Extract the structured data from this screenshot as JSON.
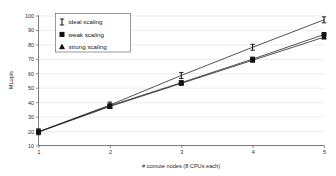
{
  "chart_data": {
    "type": "line",
    "title": "",
    "xlabel": "# comute nodes (8 CPUs each)",
    "ylabel": "MLup/s",
    "x": [
      1,
      2,
      3,
      4,
      5
    ],
    "xticklabels": [
      "1",
      "2",
      "3",
      "4",
      "5"
    ],
    "yticklabels": [
      "10",
      "20",
      "30",
      "40",
      "50",
      "60",
      "70",
      "80",
      "90",
      "100"
    ],
    "yticks": [
      10,
      20,
      30,
      40,
      50,
      60,
      70,
      80,
      90,
      100
    ],
    "xlim": [
      1,
      5
    ],
    "ylim": [
      10,
      100
    ],
    "grid": true,
    "legend_position": "upper-left",
    "series": [
      {
        "name": "ideal scaling",
        "marker": "errorbar-i",
        "values": [
          19.5,
          38.0,
          58.5,
          78.0,
          97.0
        ]
      },
      {
        "name": "weak scaling",
        "marker": "filled-square",
        "values": [
          19.5,
          37.5,
          53.5,
          69.8,
          86.8
        ]
      },
      {
        "name": "strong scaling",
        "marker": "filled-triangle",
        "values": [
          19.3,
          37.0,
          53.0,
          69.0,
          85.0
        ]
      }
    ],
    "colors": {
      "line": "#1a1a1a",
      "grid": "#d9d9d9",
      "axis": "#4a4a4a",
      "text": "#1d1d1d",
      "background": "#ffffff"
    }
  },
  "legend": {
    "entries": [
      {
        "label": "ideal scaling",
        "marker_name": "errorbar-marker-icon"
      },
      {
        "label": "weak scaling",
        "marker_name": "square-marker-icon"
      },
      {
        "label": "strong scaling",
        "marker_name": "triangle-marker-icon"
      }
    ]
  },
  "axes": {
    "y_title": "MLup/s",
    "x_title": "# comute nodes (8 CPUs each)",
    "y_labels": [
      "100",
      "90",
      "80",
      "70",
      "60",
      "50",
      "40",
      "30",
      "20",
      "10"
    ],
    "x_labels": [
      "1",
      "2",
      "3",
      "4",
      "5"
    ]
  }
}
